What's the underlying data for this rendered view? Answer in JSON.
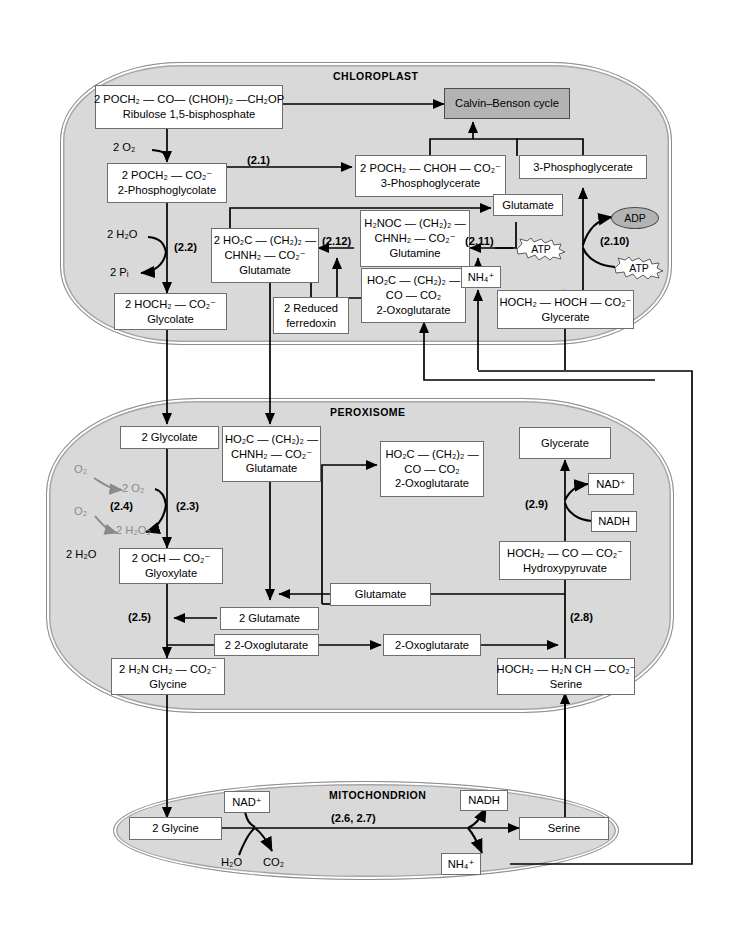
{
  "diagram": {
    "colors": {
      "organelle_fill": "#d9d9d9",
      "organelle_border": "#8c8c8c",
      "box_fill": "#ffffff",
      "box_border": "#6e6e6e",
      "shaded_box_fill": "#b3b3b3",
      "faded_text": "#8a8a8a",
      "line": "#000000",
      "page_background": "#ffffff"
    }
  },
  "organelles": [
    {
      "id": "chloroplast",
      "label": "CHLOROPLAST"
    },
    {
      "id": "peroxisome",
      "label": "PEROXISOME"
    },
    {
      "id": "mitochondrion",
      "label": "MITOCHONDRION"
    }
  ],
  "chloroplast": {
    "boxes": {
      "rubp": {
        "formula": "2 POCH₂ — CO— (CHOH)₂ —CH₂OP",
        "name": "Ribulose 1,5-bisphosphate"
      },
      "calvin": {
        "name": "Calvin–Benson cycle"
      },
      "pg3_formula": {
        "formula": "2 POCH₂ — CHOH — CO₂⁻",
        "name": "3-Phosphoglycerate"
      },
      "pg3_plain": {
        "name": "3-Phosphoglycerate"
      },
      "phosphoglycolate": {
        "formula": "2 POCH₂ — CO₂⁻",
        "name": "2-Phosphoglycolate"
      },
      "glycolate": {
        "formula": "2 HOCH₂ — CO₂⁻",
        "name": "Glycolate"
      },
      "glutamate": {
        "formula": "2 HO₂C — (CH₂)₂ —",
        "formula2": "CHNH₂ — CO₂⁻",
        "name": "Glutamate"
      },
      "glutamine": {
        "formula": "H₂NOC — (CH₂)₂ —",
        "formula2": "CHNH₂ — CO₂⁻",
        "name": "Glutamine"
      },
      "oxoglutarate": {
        "formula": "HO₂C — (CH₂)₂ —",
        "formula2": "CO — CO₂",
        "name": "2-Oxoglutarate"
      },
      "ferredoxin": {
        "name": "2 Reduced",
        "name2": "ferredoxin"
      },
      "glutamate_small": {
        "name": "Glutamate"
      },
      "ammonium": {
        "name": "NH₄⁺"
      },
      "glycerate": {
        "formula": "HOCH₂ — HOCH — CO₂⁻",
        "name": "Glycerate"
      }
    },
    "labels": {
      "o2_in": "2 O₂",
      "h2o_in": "2 H₂O",
      "pi_out": "2 Pᵢ"
    },
    "cofactors": {
      "adp": "ADP",
      "atp_210": "ATP",
      "atp_211": "ATP"
    },
    "steps": {
      "s21": "(2.1)",
      "s22": "(2.2)",
      "s210": "(2.10)",
      "s211": "(2.11)",
      "s212": "(2.12)"
    }
  },
  "peroxisome": {
    "boxes": {
      "glycolate": {
        "name": "2 Glycolate"
      },
      "glutamate_big": {
        "formula": "HO₂C — (CH₂)₂ —",
        "formula2": "CHNH₂ — CO₂⁻",
        "name": "Glutamate"
      },
      "oxoglutarate_big": {
        "formula": "HO₂C — (CH₂)₂ —",
        "formula2": "CO — CO₂",
        "name": "2-Oxoglutarate"
      },
      "glycerate": {
        "name": "Glycerate"
      },
      "nad_plus": {
        "name": "NAD⁺"
      },
      "nadh": {
        "name": "NADH"
      },
      "hydroxypyruvate": {
        "formula": "HOCH₂ — CO — CO₂⁻",
        "name": "Hydroxypyruvate"
      },
      "glyoxylate": {
        "formula": "2 OCH — CO₂⁻",
        "name": "Glyoxylate"
      },
      "glutamate_2": {
        "name": "2 Glutamate"
      },
      "oxoglutarate_2": {
        "name": "2 2-Oxoglutarate"
      },
      "glutamate_mid": {
        "name": "Glutamate"
      },
      "oxoglutarate_mid": {
        "name": "2-Oxoglutarate"
      },
      "glycine": {
        "formula": "2 H₂N CH₂ — CO₂⁻",
        "name": "Glycine"
      },
      "serine": {
        "formula": "HOCH₂ — H₂N CH — CO₂⁻",
        "name": "Serine"
      }
    },
    "labels": {
      "o2_a": "O₂",
      "o2_b": "O₂",
      "two_o2": "2 O₂",
      "two_h2o2": "2 H₂O₂",
      "two_h2o": "2 H₂O"
    },
    "steps": {
      "s23": "(2.3)",
      "s24": "(2.4)",
      "s25": "(2.5)",
      "s28": "(2.8)",
      "s29": "(2.9)"
    }
  },
  "mitochondrion": {
    "boxes": {
      "glycine": {
        "name": "2 Glycine"
      },
      "nad_plus": {
        "name": "NAD⁺"
      },
      "nadh": {
        "name": "NADH"
      },
      "serine": {
        "name": "Serine"
      },
      "ammonium": {
        "name": "NH₄⁺"
      }
    },
    "labels": {
      "h2o": "H₂O",
      "co2": "CO₂"
    },
    "steps": {
      "s26_27": "(2.6, 2.7)"
    }
  }
}
